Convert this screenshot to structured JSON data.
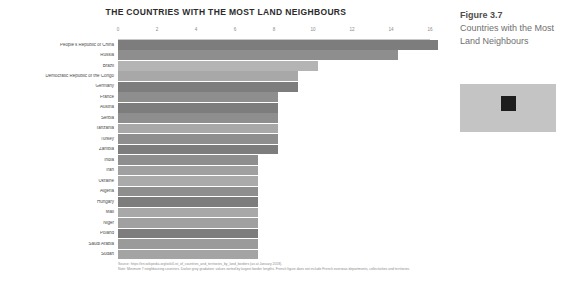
{
  "chart_data": {
    "type": "bar",
    "orientation": "horizontal",
    "title": "THE COUNTRIES WITH THE MOST LAND NEIGHBOURS",
    "xlabel": "",
    "ylabel": "",
    "xlim": [
      0,
      16
    ],
    "ticks": [
      "0",
      "2",
      "4",
      "6",
      "8",
      "10",
      "12",
      "14",
      "16"
    ],
    "grid": false,
    "legend": "none",
    "categories": [
      "People's Republic of China",
      "Russia",
      "Brazil",
      "Democratic Republic of the Congo",
      "Germany",
      "France",
      "Austria",
      "Serbia",
      "Tanzania",
      "Turkey",
      "Zambia",
      "India",
      "Iran",
      "Ukraine",
      "Algeria",
      "Hungary",
      "Mali",
      "Niger",
      "Poland",
      "Saudi Arabia",
      "Sudan"
    ],
    "values": [
      16,
      14,
      10,
      9,
      9,
      8,
      8,
      8,
      8,
      8,
      8,
      7,
      7,
      7,
      7,
      7,
      7,
      7,
      7,
      7,
      7
    ],
    "bar_colors": [
      "#7d7d7d",
      "#8e8e8e",
      "#b4b4b4",
      "#a8a8a8",
      "#7d7d7d",
      "#8e8e8e",
      "#7d7d7d",
      "#8e8e8e",
      "#a8a8a8",
      "#8e8e8e",
      "#7d7d7d",
      "#8e8e8e",
      "#a0a0a0",
      "#aaaaaa",
      "#8e8e8e",
      "#7d7d7d",
      "#a8a8a8",
      "#a0a0a0",
      "#7d7d7d",
      "#9a9a9a",
      "#a4a4a4"
    ]
  },
  "notes": {
    "source": "Source: https://en.wikipedia.org/wiki/List_of_countries_and_territories_by_land_borders (as at January 2018).",
    "note": "Note: Minimum 7 neighbouring countries. Darker grey gradation; values sorted by largest border lengths. French figure does not include French overseas departments, collectivities and territories."
  },
  "caption": {
    "figure_number": "Figure 3.7",
    "description": "Countries with the Most Land Neighbours"
  },
  "placeholder": {
    "icon": "broken-image-icon"
  }
}
